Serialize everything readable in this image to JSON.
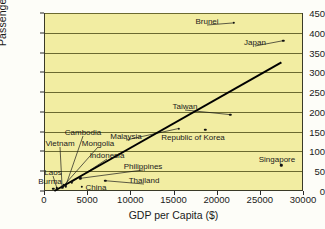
{
  "chart_data": {
    "type": "scatter",
    "title": "",
    "xlabel": "GDP per Capita ($)",
    "ylabel": "Passenger Vehicles per Thousand",
    "xlim": [
      0,
      30000
    ],
    "ylim": [
      0,
      450
    ],
    "xticks": [
      0,
      5000,
      10000,
      15000,
      20000,
      25000,
      30000
    ],
    "yticks": [
      0,
      50,
      100,
      150,
      200,
      250,
      300,
      350,
      400,
      450
    ],
    "grid": true,
    "legend": "none",
    "plot_background": "#f2eda2",
    "marker_color": "#111111",
    "trendline": {
      "label": "",
      "x": [
        1200,
        27500
      ],
      "y": [
        0,
        325
      ],
      "color": "#000000"
    },
    "points": [
      {
        "name": "Brunei",
        "x": 22000,
        "y": 425,
        "label_dx": 13,
        "label_dy": 0
      },
      {
        "name": "Japan",
        "x": 27700,
        "y": 380,
        "label_dx": 15,
        "label_dy": 0
      },
      {
        "name": "Taiwan",
        "x": 21600,
        "y": 193,
        "label_dx": 0,
        "label_dy": -12
      },
      {
        "name": "Republic of Korea",
        "x": 18700,
        "y": 155,
        "label_dx": 45,
        "label_dy": 9
      },
      {
        "name": "Malaysia",
        "x": 15600,
        "y": 158,
        "label_dx": -2,
        "label_dy": 10
      },
      {
        "name": "Singapore",
        "x": 27500,
        "y": 65,
        "label_dx": 0,
        "label_dy": 10
      },
      {
        "name": "Cambodia",
        "x": 2500,
        "y": 12,
        "label_dx": 0,
        "label_dy": 0
      },
      {
        "name": "Vietnam",
        "x": 2100,
        "y": 9,
        "label_dx": 0,
        "label_dy": 0
      },
      {
        "name": "Mongolia",
        "x": 2300,
        "y": 14,
        "label_dx": 0,
        "label_dy": 0
      },
      {
        "name": "Indonesia",
        "x": 3200,
        "y": 22,
        "label_dx": 0,
        "label_dy": 0
      },
      {
        "name": "Laos",
        "x": 1500,
        "y": 7,
        "label_dx": 0,
        "label_dy": 0
      },
      {
        "name": "Burma",
        "x": 1100,
        "y": 5,
        "label_dx": 0,
        "label_dy": 0
      },
      {
        "name": "China",
        "x": 4400,
        "y": 10,
        "label_dx": 0,
        "label_dy": 0
      },
      {
        "name": "Philippines",
        "x": 4200,
        "y": 32,
        "label_dx": 0,
        "label_dy": 0
      },
      {
        "name": "Thailand",
        "x": 7100,
        "y": 26,
        "label_dx": 0,
        "label_dy": 0
      }
    ],
    "callout_labels": [
      {
        "name": "Cambodia",
        "text": "Cambodia",
        "x": 83,
        "y": 132
      },
      {
        "name": "Vietnam",
        "text": "Vietnam",
        "x": 60,
        "y": 143
      },
      {
        "name": "Mongolia",
        "text": "Mongolia",
        "x": 98,
        "y": 143
      },
      {
        "name": "Indonesia",
        "text": "Indonesia",
        "x": 107,
        "y": 155
      },
      {
        "name": "Laos",
        "text": "Laos",
        "x": 53,
        "y": 172
      },
      {
        "name": "Burma",
        "text": "Burma",
        "x": 50,
        "y": 181
      },
      {
        "name": "China",
        "text": "China",
        "x": 96,
        "y": 187
      },
      {
        "name": "Philippines",
        "text": "Philippines",
        "x": 143,
        "y": 166
      },
      {
        "name": "Thailand",
        "text": "Thailand",
        "x": 144,
        "y": 180
      },
      {
        "name": "Malaysia",
        "text": "Malaysia",
        "x": 126,
        "y": 136
      },
      {
        "name": "Taiwan",
        "text": "Taiwan",
        "x": 185,
        "y": 106
      },
      {
        "name": "Korea",
        "text": "Republic of Korea",
        "x": 193,
        "y": 137
      },
      {
        "name": "Brunei",
        "text": "Brunei",
        "x": 207,
        "y": 21
      },
      {
        "name": "Japan",
        "text": "Japan",
        "x": 255,
        "y": 42
      },
      {
        "name": "Singapore",
        "text": "Singapore",
        "x": 277,
        "y": 159
      }
    ]
  }
}
